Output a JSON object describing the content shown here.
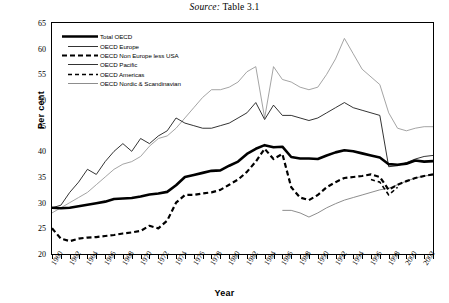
{
  "source_note": {
    "prefix": "Source:",
    "text": "Table 3.1"
  },
  "axes": {
    "ylabel": "Per cent",
    "xlabel": "Year",
    "yticks": [
      20,
      25,
      30,
      35,
      40,
      45,
      50,
      55,
      60,
      65
    ],
    "xticks": [
      "1960",
      "1962",
      "1964",
      "1966",
      "1968",
      "1970",
      "1972",
      "1974",
      "1976",
      "1978",
      "1980",
      "1982",
      "1984",
      "1986",
      "1988",
      "1990",
      "1992",
      "1994",
      "1996",
      "1998",
      "2000",
      "2002"
    ]
  },
  "chart_data": {
    "type": "line",
    "title": "",
    "xlabel": "Year",
    "ylabel": "Per cent",
    "xlim": [
      1960,
      2003
    ],
    "ylim": [
      20,
      65
    ],
    "grid": false,
    "legend_position": "upper-left",
    "x": [
      1960,
      1961,
      1962,
      1963,
      1964,
      1965,
      1966,
      1967,
      1968,
      1969,
      1970,
      1971,
      1972,
      1973,
      1974,
      1975,
      1976,
      1977,
      1978,
      1979,
      1980,
      1981,
      1982,
      1983,
      1984,
      1985,
      1986,
      1987,
      1988,
      1989,
      1990,
      1991,
      1992,
      1993,
      1994,
      1995,
      1996,
      1997,
      1998,
      1999,
      2000,
      2001,
      2002,
      2003
    ],
    "series": [
      {
        "name": "Total OECD",
        "style": "thick-solid",
        "color": "#000000",
        "values": [
          29.0,
          28.9,
          29.0,
          29.3,
          29.6,
          29.9,
          30.2,
          30.7,
          30.8,
          30.9,
          31.2,
          31.6,
          31.8,
          32.1,
          33.4,
          35.0,
          35.4,
          35.8,
          36.2,
          36.3,
          37.2,
          38.0,
          39.5,
          40.5,
          41.2,
          40.8,
          40.9,
          38.9,
          38.6,
          38.6,
          38.5,
          39.2,
          39.8,
          40.2,
          40.0,
          39.6,
          39.2,
          38.8,
          37.5,
          37.4,
          37.6,
          38.2,
          38.0,
          38.1
        ]
      },
      {
        "name": "OECD Europe",
        "style": "thin-solid",
        "color": "#000000",
        "values": [
          29.0,
          29.5,
          32.0,
          34.0,
          36.5,
          35.5,
          38.0,
          40.0,
          41.5,
          40.0,
          42.5,
          41.5,
          43.0,
          44.0,
          46.5,
          45.5,
          45.0,
          44.5,
          44.5,
          45.0,
          45.5,
          46.5,
          47.5,
          49.5,
          46.2,
          49.0,
          47.0,
          47.0,
          46.5,
          46.0,
          46.5,
          47.5,
          48.5,
          49.5,
          48.5,
          48.0,
          47.5,
          47.0,
          37.0,
          37.2,
          37.8,
          38.5,
          39.0,
          39.2
        ]
      },
      {
        "name": "OECD Non Europe less USA",
        "style": "thick-dashed",
        "color": "#000000",
        "values": [
          25.0,
          23.0,
          22.5,
          23.0,
          23.2,
          23.3,
          23.5,
          23.7,
          24.0,
          24.2,
          24.5,
          25.5,
          25.0,
          26.5,
          30.0,
          31.5,
          31.5,
          31.8,
          32.0,
          32.5,
          33.5,
          34.5,
          36.0,
          38.0,
          40.5,
          38.5,
          39.5,
          33.0,
          31.0,
          30.5,
          31.5,
          33.0,
          34.0,
          34.8,
          35.0,
          35.2,
          35.5,
          35.0,
          32.5,
          33.5,
          34.2,
          34.8,
          35.2,
          35.5
        ]
      },
      {
        "name": "OECD Pacific",
        "style": "thin-solid-gray",
        "color": "#808080",
        "start_year": 1986,
        "values": [
          null,
          null,
          null,
          null,
          null,
          null,
          null,
          null,
          null,
          null,
          null,
          null,
          null,
          null,
          null,
          null,
          null,
          null,
          null,
          null,
          null,
          null,
          null,
          null,
          null,
          null,
          28.5,
          28.5,
          28.0,
          27.2,
          28.0,
          29.0,
          29.8,
          30.5,
          31.0,
          31.5,
          32.0,
          32.5,
          32.8,
          33.5,
          34.2,
          34.8,
          35.2,
          35.4
        ]
      },
      {
        "name": "OECD Americas",
        "style": "thin-dashed",
        "color": "#000000",
        "start_year": 1996,
        "values": [
          null,
          null,
          null,
          null,
          null,
          null,
          null,
          null,
          null,
          null,
          null,
          null,
          null,
          null,
          null,
          null,
          null,
          null,
          null,
          null,
          null,
          null,
          null,
          null,
          null,
          null,
          null,
          null,
          null,
          null,
          null,
          null,
          null,
          null,
          null,
          null,
          34.5,
          34.0,
          31.5,
          33.0,
          null,
          null,
          null,
          null
        ]
      },
      {
        "name": "OECD Nordic & Scandinavian",
        "style": "thin-solid-lightgray",
        "color": "#9a9a9a",
        "values": [
          28.0,
          29.0,
          30.0,
          31.0,
          32.0,
          33.5,
          35.0,
          36.5,
          37.5,
          38.0,
          39.0,
          41.0,
          42.5,
          43.0,
          44.5,
          46.5,
          48.5,
          50.5,
          52.0,
          52.0,
          52.5,
          53.5,
          55.5,
          56.5,
          46.5,
          56.5,
          54.0,
          53.5,
          52.5,
          52.0,
          52.5,
          55.0,
          58.0,
          62.0,
          59.0,
          56.0,
          54.5,
          53.0,
          47.5,
          44.5,
          44.0,
          44.5,
          44.8,
          44.8
        ]
      }
    ]
  },
  "legend": [
    {
      "label": "Total OECD",
      "style": "thick-solid"
    },
    {
      "label": "OECD Europe",
      "style": "thin-solid"
    },
    {
      "label": "OECD Non Europe less USA",
      "style": "thick-dashed"
    },
    {
      "label": "OECD Pacific",
      "style": "thin-solid"
    },
    {
      "label": "OECD Americas",
      "style": "thin-dashed"
    },
    {
      "label": "OECD Nordic & Scandinavian",
      "style": "thin-solid-gray"
    }
  ]
}
